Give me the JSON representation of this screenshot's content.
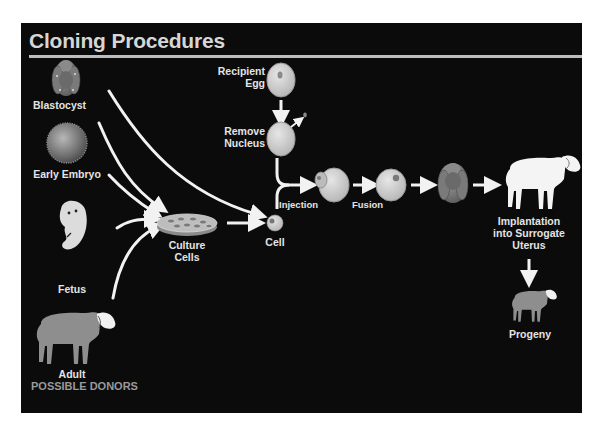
{
  "title": "Cloning Procedures",
  "donors": {
    "heading": "POSSIBLE DONORS",
    "items": [
      {
        "label": "Blastocyst"
      },
      {
        "label": "Early Embryo"
      },
      {
        "label": "Fetus"
      },
      {
        "label": "Adult"
      }
    ]
  },
  "steps": {
    "culture": {
      "line1": "Culture",
      "line2": "Cells"
    },
    "cell": "Cell",
    "recipient": {
      "line1": "Recipient",
      "line2": "Egg"
    },
    "remove": {
      "line1": "Remove",
      "line2": "Nucleus"
    },
    "injection": "Injection",
    "fusion": "Fusion",
    "implantation": {
      "line1": "Implantation",
      "line2": "into Surrogate",
      "line3": "Uterus"
    },
    "progeny": "Progeny"
  },
  "colors": {
    "background": "#0b0b0b",
    "title": "#d6d6d6",
    "rule": "#bdbdbd",
    "label": "#e4e4e4",
    "donors_heading": "#9a9a9a",
    "arrow": "#f2f2f2",
    "sheep_gray": "#8e8e8e",
    "sheep_white": "#f4f4f4",
    "egg": "#cfcfcf"
  }
}
